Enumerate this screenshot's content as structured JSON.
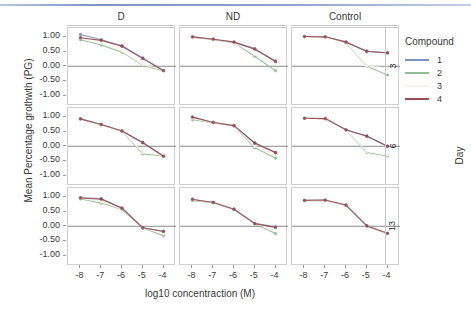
{
  "figure": {
    "x_axis_title": "log10 concentraction (M)",
    "y_axis_title": "Mean Percentage grothwth (PG)",
    "column_labels": [
      "D",
      "ND",
      "Control"
    ],
    "row_labels": [
      "3",
      "6",
      "13"
    ],
    "row_group_title": "Day",
    "x_ticks": [
      "-8",
      "-7",
      "-6",
      "-5",
      "-4"
    ],
    "y_ticks": [
      "1.00",
      "0.50",
      "0.00",
      "-0.50",
      "-1.00"
    ]
  },
  "legend": {
    "title": "Compound",
    "items": [
      {
        "label": "1",
        "color": "#7b93c4"
      },
      {
        "label": "2",
        "color": "#8fbf93"
      },
      {
        "label": "3",
        "color": "#f7f3e3"
      },
      {
        "label": "4",
        "color": "#9c4a52"
      }
    ]
  },
  "chart_data": {
    "type": "line",
    "title": "",
    "xlabel": "log10 concentraction (M)",
    "ylabel": "Mean Percentage grothwth (PG)",
    "x": [
      -8,
      -7,
      -6,
      -5,
      -4
    ],
    "xlim": [
      -8.6,
      -3.4
    ],
    "ylim": [
      -1.35,
      1.3
    ],
    "grid": false,
    "zero_reference_line": 0.0,
    "facet_columns": [
      "D",
      "ND",
      "Control"
    ],
    "facet_rows": [
      "3",
      "6",
      "13"
    ],
    "facet_row_variable": "Day",
    "legend_position": "right",
    "panels": [
      {
        "column": "D",
        "row": "3",
        "series": [
          {
            "name": "1",
            "color": "#7b93c4",
            "values": [
              1.08,
              0.9,
              0.7,
              0.28,
              -0.14
            ]
          },
          {
            "name": "2",
            "color": "#8fbf93",
            "values": [
              0.9,
              0.72,
              0.48,
              0.03,
              -0.15
            ]
          },
          {
            "name": "3",
            "color": "#f7f3e3",
            "values": [
              0.96,
              0.78,
              0.52,
              0.05,
              -0.13
            ]
          },
          {
            "name": "4",
            "color": "#9c4a52",
            "values": [
              0.97,
              0.88,
              0.68,
              0.26,
              -0.15
            ]
          }
        ]
      },
      {
        "column": "ND",
        "row": "3",
        "series": [
          {
            "name": "1",
            "color": "#7b93c4",
            "values": [
              1.0,
              0.92,
              0.82,
              0.6,
              0.18
            ]
          },
          {
            "name": "2",
            "color": "#8fbf93",
            "values": [
              0.99,
              0.9,
              0.8,
              0.34,
              -0.15
            ]
          },
          {
            "name": "3",
            "color": "#f7f3e3",
            "values": [
              1.0,
              0.91,
              0.81,
              0.4,
              0.1
            ]
          },
          {
            "name": "4",
            "color": "#9c4a52",
            "values": [
              1.0,
              0.92,
              0.82,
              0.58,
              0.16
            ]
          }
        ]
      },
      {
        "column": "Control",
        "row": "3",
        "series": [
          {
            "name": "1",
            "color": "#7b93c4",
            "values": [
              1.01,
              1.0,
              0.83,
              0.52,
              0.46
            ]
          },
          {
            "name": "2",
            "color": "#8fbf93",
            "values": [
              1.01,
              1.0,
              0.8,
              0.0,
              -0.3
            ]
          },
          {
            "name": "3",
            "color": "#f7f3e3",
            "values": [
              1.01,
              1.0,
              0.81,
              0.01,
              -0.06
            ]
          },
          {
            "name": "4",
            "color": "#9c4a52",
            "values": [
              1.01,
              1.0,
              0.82,
              0.5,
              0.45
            ]
          }
        ]
      },
      {
        "column": "D",
        "row": "6",
        "series": [
          {
            "name": "1",
            "color": "#7b93c4",
            "values": [
              0.93,
              0.74,
              0.52,
              0.13,
              -0.33
            ]
          },
          {
            "name": "2",
            "color": "#8fbf93",
            "values": [
              0.93,
              0.73,
              0.51,
              -0.26,
              -0.33
            ]
          },
          {
            "name": "3",
            "color": "#f7f3e3",
            "values": [
              0.93,
              0.73,
              0.52,
              -0.22,
              -0.3
            ]
          },
          {
            "name": "4",
            "color": "#9c4a52",
            "values": [
              0.93,
              0.74,
              0.52,
              0.12,
              -0.34
            ]
          }
        ]
      },
      {
        "column": "ND",
        "row": "6",
        "series": [
          {
            "name": "1",
            "color": "#7b93c4",
            "values": [
              0.99,
              0.81,
              0.7,
              0.12,
              -0.2
            ]
          },
          {
            "name": "2",
            "color": "#8fbf93",
            "values": [
              0.9,
              0.8,
              0.69,
              -0.05,
              -0.4
            ]
          },
          {
            "name": "3",
            "color": "#f7f3e3",
            "values": [
              0.95,
              0.8,
              0.7,
              0.0,
              -0.3
            ]
          },
          {
            "name": "4",
            "color": "#9c4a52",
            "values": [
              0.99,
              0.81,
              0.7,
              0.1,
              -0.22
            ]
          }
        ]
      },
      {
        "column": "Control",
        "row": "6",
        "series": [
          {
            "name": "1",
            "color": "#7b93c4",
            "values": [
              0.95,
              0.94,
              0.55,
              0.35,
              0.0
            ]
          },
          {
            "name": "2",
            "color": "#8fbf93",
            "values": [
              0.95,
              0.94,
              0.55,
              -0.21,
              -0.33
            ]
          },
          {
            "name": "3",
            "color": "#f7f3e3",
            "values": [
              0.95,
              0.94,
              0.55,
              -0.18,
              -0.3
            ]
          },
          {
            "name": "4",
            "color": "#9c4a52",
            "values": [
              0.95,
              0.94,
              0.56,
              0.34,
              0.0
            ]
          }
        ]
      },
      {
        "column": "D",
        "row": "13",
        "series": [
          {
            "name": "1",
            "color": "#7b93c4",
            "values": [
              0.97,
              0.94,
              0.62,
              -0.05,
              -0.17
            ]
          },
          {
            "name": "2",
            "color": "#8fbf93",
            "values": [
              0.93,
              0.79,
              0.57,
              -0.06,
              -0.32
            ]
          },
          {
            "name": "3",
            "color": "#f7f3e3",
            "values": [
              0.95,
              0.83,
              0.59,
              -0.05,
              -0.25
            ]
          },
          {
            "name": "4",
            "color": "#9c4a52",
            "values": [
              0.96,
              0.92,
              0.61,
              -0.05,
              -0.18
            ]
          }
        ]
      },
      {
        "column": "ND",
        "row": "13",
        "series": [
          {
            "name": "1",
            "color": "#7b93c4",
            "values": [
              0.92,
              0.81,
              0.58,
              0.1,
              -0.02
            ]
          },
          {
            "name": "2",
            "color": "#8fbf93",
            "values": [
              0.87,
              0.8,
              0.57,
              0.08,
              -0.25
            ]
          },
          {
            "name": "3",
            "color": "#f7f3e3",
            "values": [
              0.89,
              0.8,
              0.58,
              0.09,
              -0.12
            ]
          },
          {
            "name": "4",
            "color": "#9c4a52",
            "values": [
              0.91,
              0.81,
              0.58,
              0.09,
              -0.04
            ]
          }
        ]
      },
      {
        "column": "Control",
        "row": "13",
        "series": [
          {
            "name": "1",
            "color": "#7b93c4",
            "values": [
              0.88,
              0.88,
              0.72,
              0.02,
              -0.25
            ]
          },
          {
            "name": "2",
            "color": "#8fbf93",
            "values": [
              0.87,
              0.88,
              0.71,
              -0.01,
              -0.25
            ]
          },
          {
            "name": "3",
            "color": "#f7f3e3",
            "values": [
              0.88,
              0.88,
              0.72,
              0.0,
              -0.25
            ]
          },
          {
            "name": "4",
            "color": "#9c4a52",
            "values": [
              0.88,
              0.89,
              0.72,
              0.01,
              -0.24
            ]
          }
        ]
      }
    ]
  }
}
